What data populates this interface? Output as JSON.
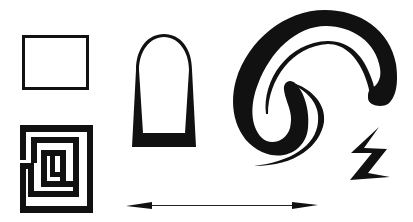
{
  "figure": {
    "title": "Black line-art shapes",
    "background": "#ffffff",
    "ink": "#000000"
  },
  "shapes": [
    {
      "id": "rectangle",
      "label": "outlined rectangle"
    },
    {
      "id": "maze",
      "label": "square maze / labyrinth"
    },
    {
      "id": "arch",
      "label": "arch (tombstone) outline with tapered walls"
    },
    {
      "id": "swirl",
      "label": "thick S-shaped swirl with thin tails"
    },
    {
      "id": "lightning",
      "label": "lightning bolt"
    },
    {
      "id": "arrow",
      "label": "double-headed horizontal arrow"
    }
  ]
}
